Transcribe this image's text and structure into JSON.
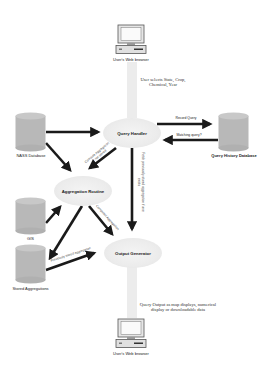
{
  "diagram": {
    "nodes": {
      "user_browser_top": {
        "label": "User's Web browser"
      },
      "query_handler": {
        "label": "Query Handler"
      },
      "nass_database": {
        "label": "NASS Database"
      },
      "query_history_database": {
        "label": "Query History Database"
      },
      "aggregation_routine": {
        "label": "Aggregation Routine"
      },
      "gis": {
        "label": "GIS"
      },
      "stored_aggregations": {
        "label": "Stored Aggregations"
      },
      "output_generator": {
        "label": "Output Generator"
      },
      "user_browser_bottom": {
        "label": "User's Web browser"
      }
    },
    "annotations": {
      "user_selects": "User selects State, Crop, Chemical, Year",
      "query_output": "Query Output as map displays, numerical display or downloadable data"
    },
    "edges": {
      "record_query": "Record Query",
      "matching_query": "Matching query?",
      "compute_aggregation": "Compute Aggregation if not stored",
      "fetch_stored": "Fetch previously stored aggregation if one exists",
      "computed_aggregation": "Computed Aggregation",
      "stored_aggregation": "Previously stored aggregation"
    },
    "colors": {
      "arrow": "#1a1a1a",
      "cylinder": "#b8b8b8",
      "ellipse": "#ececec",
      "light_arrow": "#ececec"
    }
  }
}
